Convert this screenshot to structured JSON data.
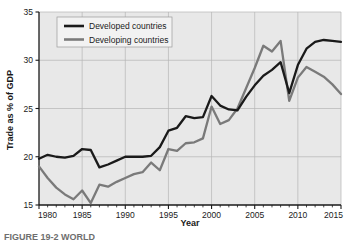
{
  "figure": {
    "background": "#ffffff",
    "plot_background": "#e8e8e8",
    "caption": "FIGURE 19-2  WORLD"
  },
  "chart_data": {
    "type": "line",
    "title": "",
    "xlabel": "Year",
    "ylabel": "Trade as % of GDP",
    "xlim": [
      1980,
      2015
    ],
    "ylim": [
      15,
      35
    ],
    "xticks": [
      1980,
      1985,
      1990,
      1995,
      2000,
      2005,
      2010,
      2015
    ],
    "yticks": [
      15,
      20,
      25,
      30,
      35
    ],
    "xtick_labels": [
      "1980",
      "1985",
      "1990",
      "1995",
      "2000",
      "2005",
      "2010",
      "2015"
    ],
    "ytick_labels": [
      "15",
      "20",
      "25",
      "30",
      "35"
    ],
    "minor_xticks": true,
    "grid": true,
    "legend_position": "top-left",
    "x": [
      1980,
      1981,
      1982,
      1983,
      1984,
      1985,
      1986,
      1987,
      1988,
      1989,
      1990,
      1991,
      1992,
      1993,
      1994,
      1995,
      1996,
      1997,
      1998,
      1999,
      2000,
      2001,
      2002,
      2003,
      2004,
      2005,
      2006,
      2007,
      2008,
      2009,
      2010,
      2011,
      2012,
      2013,
      2014,
      2015
    ],
    "series": [
      {
        "name": "Developed countries",
        "color": "#1a1a1a",
        "values": [
          19.8,
          20.2,
          20.0,
          19.9,
          20.1,
          20.8,
          20.7,
          18.9,
          19.2,
          19.6,
          20.0,
          20.0,
          20.0,
          20.1,
          21.0,
          22.7,
          23.0,
          24.2,
          24.0,
          24.1,
          26.3,
          25.3,
          24.9,
          24.8,
          26.2,
          27.4,
          28.4,
          29.0,
          29.8,
          26.6,
          29.5,
          31.2,
          31.9,
          32.1,
          32.0,
          31.9
        ]
      },
      {
        "name": "Developing countries",
        "color": "#7a7a7a",
        "values": [
          19.0,
          17.8,
          16.8,
          16.1,
          15.6,
          16.5,
          15.2,
          17.1,
          16.9,
          17.4,
          17.8,
          18.2,
          18.4,
          19.4,
          18.6,
          20.8,
          20.6,
          21.4,
          21.5,
          21.9,
          25.2,
          23.4,
          23.8,
          25.0,
          27.1,
          29.2,
          31.5,
          30.9,
          32.0,
          25.8,
          28.2,
          29.3,
          28.8,
          28.3,
          27.5,
          26.5
        ]
      }
    ]
  },
  "legend": {
    "items": [
      {
        "label": "Developed countries",
        "color": "#1a1a1a"
      },
      {
        "label": "Developing countries",
        "color": "#7a7a7a"
      }
    ]
  }
}
